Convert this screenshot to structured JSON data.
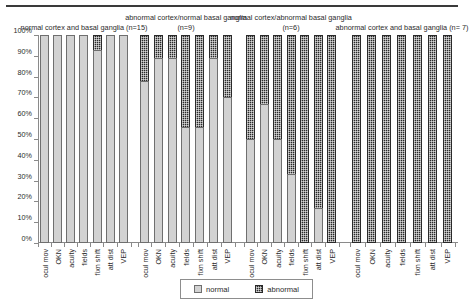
{
  "chart_data": {
    "type": "bar",
    "title": "",
    "subtitle": "",
    "xlabel": "",
    "ylabel": "",
    "ylim": [
      0,
      100
    ],
    "y_tick_labels": [
      "100%",
      "90%",
      "80%",
      "70%",
      "60%",
      "50%",
      "40%",
      "30%",
      "20%",
      "10%",
      "0%"
    ],
    "y_tick_values": [
      100,
      90,
      80,
      70,
      60,
      50,
      40,
      30,
      20,
      10,
      0
    ],
    "grid": false,
    "stacked": true,
    "legend_position": "bottom-center",
    "legend": [
      "normal",
      "abnormal"
    ],
    "series": [
      {
        "name": "normal",
        "color": "#d2d2d2"
      },
      {
        "name": "abnormal",
        "color": "#2a2a2a"
      }
    ],
    "categories": [
      "ocul mov",
      "OKN",
      "acuity",
      "fields",
      "fixn shift",
      "att dist",
      "VEP"
    ],
    "groups": [
      {
        "title": "normal cortex and basal ganglia (n=15)",
        "n": 15,
        "normal": [
          100,
          100,
          100,
          100,
          93,
          100,
          100
        ],
        "abnormal": [
          0,
          0,
          0,
          0,
          7,
          0,
          0
        ]
      },
      {
        "title": "abnormal cortex/normal basal ganglia (n=9)",
        "n": 9,
        "normal": [
          78,
          89,
          89,
          56,
          56,
          89,
          70
        ],
        "abnormal": [
          22,
          11,
          11,
          44,
          44,
          11,
          30
        ]
      },
      {
        "title": "normal cortex/abnormal basal ganglia (n=6)",
        "n": 6,
        "normal": [
          50,
          67,
          50,
          33,
          0,
          17,
          0
        ],
        "abnormal": [
          50,
          33,
          50,
          67,
          100,
          83,
          100
        ]
      },
      {
        "title": "abnormal cortex and basal ganglia (n= 7)",
        "n": 7,
        "normal": [
          0,
          0,
          0,
          0,
          0,
          0,
          0
        ],
        "abnormal": [
          100,
          100,
          100,
          100,
          100,
          100,
          100
        ]
      }
    ]
  },
  "legend": {
    "normal_label": "normal",
    "abnormal_label": "abnormal"
  },
  "colors": {
    "normal": "#d2d2d2",
    "abnormal": "#2a2a2a",
    "axis": "#8a8a8a",
    "text": "#2b2b2b"
  }
}
